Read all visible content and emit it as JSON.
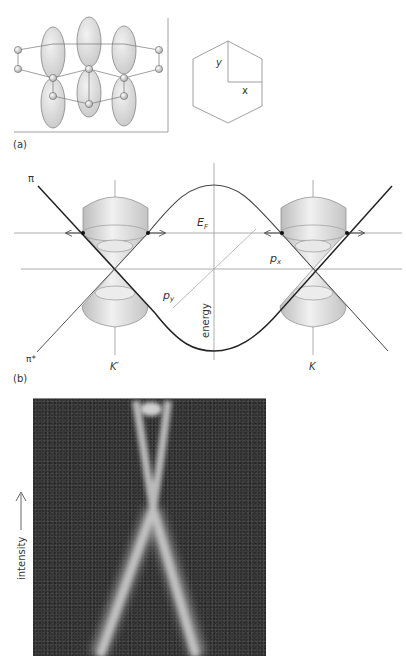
{
  "figure": {
    "panel_a": {
      "label": "(a)",
      "lattice": {
        "description": "graphene lattice with p-orbital lobes",
        "orbital_columns": 3
      },
      "hexagon": {
        "axis_labels": {
          "y": "y",
          "x": "x"
        }
      }
    },
    "panel_b": {
      "label": "(b)",
      "band_labels": {
        "pi": "π",
        "pi_star": "π*"
      },
      "fermi_label": "E",
      "fermi_subscript": "F",
      "momentum_labels": {
        "px": "p",
        "px_sub": "x",
        "py": "p",
        "py_sub": "y"
      },
      "energy_axis_label": "energy",
      "valley_labels": {
        "k_prime": "K′",
        "k": "K"
      }
    },
    "panel_c": {
      "intensity_label": "intensity",
      "image_description": "ARPES intensity map showing linear Dirac cone dispersion"
    }
  },
  "colors": {
    "line": "#555555",
    "dark_line": "#222222",
    "cone_fill": "#d8d8d8",
    "orbital_fill": "#dedede",
    "photo_bg": "#3b3b3b",
    "photo_band": "#bdbdbd"
  }
}
